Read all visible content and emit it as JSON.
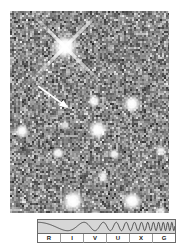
{
  "figure": {
    "type": "astronomical-image-with-spectrum-bar",
    "sky_image": {
      "alt": "grayscale optical star field image",
      "background_gray": "#8a8a8a",
      "frame": {
        "x": 10,
        "y": 11,
        "width": 159,
        "height": 202
      },
      "marker": {
        "kind": "arrow",
        "color": "#ffffff",
        "points_to": "target object",
        "tail": {
          "x": 28,
          "y": 75
        },
        "head": {
          "x": 57,
          "y": 96
        }
      },
      "sources": [
        {
          "name": "bright-star-diffraction-spikes",
          "cx": 55,
          "cy": 36,
          "r": 15,
          "peak": 1.0,
          "spikes": true
        },
        {
          "name": "star",
          "cx": 12,
          "cy": 120,
          "r": 8,
          "peak": 0.97
        },
        {
          "name": "star",
          "cx": 48,
          "cy": 142,
          "r": 7,
          "peak": 0.93
        },
        {
          "name": "star",
          "cx": 55,
          "cy": 114,
          "r": 6,
          "peak": 0.72
        },
        {
          "name": "star",
          "cx": 88,
          "cy": 119,
          "r": 11,
          "peak": 1.0
        },
        {
          "name": "star",
          "cx": 84,
          "cy": 90,
          "r": 7,
          "peak": 0.95
        },
        {
          "name": "star",
          "cx": 122,
          "cy": 93,
          "r": 10,
          "peak": 1.0
        },
        {
          "name": "star",
          "cx": 104,
          "cy": 143,
          "r": 6,
          "peak": 0.9
        },
        {
          "name": "star",
          "cx": 93,
          "cy": 166,
          "r": 6,
          "peak": 0.9
        },
        {
          "name": "star",
          "cx": 151,
          "cy": 140,
          "r": 6,
          "peak": 0.88
        },
        {
          "name": "star",
          "cx": 63,
          "cy": 190,
          "r": 13,
          "peak": 1.0
        },
        {
          "name": "star",
          "cx": 122,
          "cy": 190,
          "r": 11,
          "peak": 1.0
        },
        {
          "name": "star",
          "cx": 85,
          "cy": 205,
          "r": 7,
          "peak": 0.85
        },
        {
          "name": "star",
          "cx": 151,
          "cy": 200,
          "r": 6,
          "peak": 0.8
        }
      ]
    },
    "spectrum": {
      "caption": "electromagnetic spectrum band indicator",
      "wave_description": "sine wave with wavelength decreasing left to right",
      "panel_color": "#d6d6d6",
      "border_color": "#6b6b6b",
      "bands": [
        {
          "letter": "R",
          "name": "Radio"
        },
        {
          "letter": "I",
          "name": "Infrared"
        },
        {
          "letter": "V",
          "name": "Visible"
        },
        {
          "letter": "U",
          "name": "Ultraviolet"
        },
        {
          "letter": "X",
          "name": "X-ray"
        },
        {
          "letter": "G",
          "name": "Gamma ray"
        }
      ]
    }
  }
}
